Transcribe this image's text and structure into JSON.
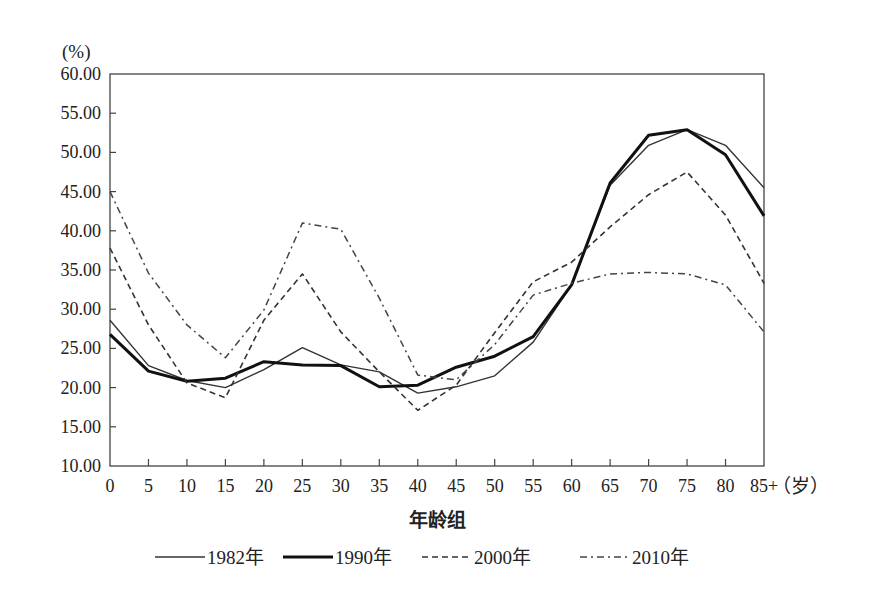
{
  "chart_data": {
    "type": "line",
    "title": "",
    "ylabel": "(%)",
    "xlabel": "年龄组",
    "x_unit": "（岁）",
    "ylim": [
      10,
      60
    ],
    "yticks": [
      "10.00",
      "15.00",
      "20.00",
      "25.00",
      "30.00",
      "35.00",
      "40.00",
      "45.00",
      "50.00",
      "55.00",
      "60.00"
    ],
    "categories": [
      "0",
      "5",
      "10",
      "15",
      "20",
      "25",
      "30",
      "35",
      "40",
      "45",
      "50",
      "55",
      "60",
      "65",
      "70",
      "75",
      "80",
      "85+"
    ],
    "grid": false,
    "legend_position": "bottom",
    "series": [
      {
        "name": "1982年",
        "style": "solid-thin",
        "values": [
          28.6,
          22.8,
          20.9,
          20.0,
          22.3,
          25.1,
          22.9,
          22.0,
          19.3,
          20.1,
          21.5,
          25.8,
          33.1,
          45.8,
          50.9,
          52.9,
          50.9,
          45.5
        ]
      },
      {
        "name": "1990年",
        "style": "solid-thick",
        "values": [
          26.8,
          22.1,
          20.8,
          21.2,
          23.3,
          22.9,
          22.8,
          20.1,
          20.3,
          22.6,
          24.0,
          26.5,
          33.1,
          46.1,
          52.2,
          52.9,
          49.7,
          41.9
        ]
      },
      {
        "name": "2000年",
        "style": "dashed",
        "values": [
          37.8,
          28.0,
          20.6,
          18.7,
          28.6,
          34.5,
          27.1,
          22.0,
          17.1,
          20.3,
          27.0,
          33.5,
          36.0,
          40.5,
          44.6,
          47.5,
          42.0,
          33.3
        ]
      },
      {
        "name": "2010年",
        "style": "dash-dot",
        "values": [
          45.0,
          34.6,
          28.0,
          23.8,
          29.9,
          41.0,
          40.2,
          31.4,
          21.6,
          21.0,
          25.5,
          31.8,
          33.3,
          34.5,
          34.7,
          34.5,
          33.1,
          27.1
        ]
      }
    ]
  }
}
